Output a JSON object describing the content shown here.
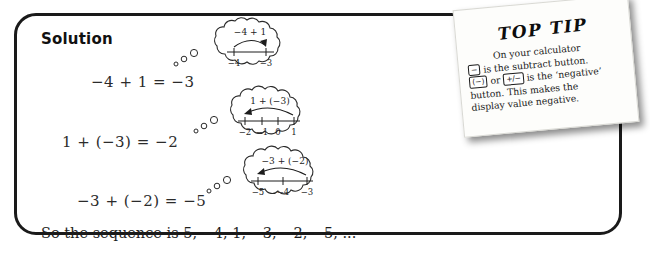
{
  "solution": {
    "title": "Solution",
    "equations": [
      {
        "id": "eq1",
        "text": "−4 + 1 = −3"
      },
      {
        "id": "eq2",
        "text": "1 + (−3) = −2"
      },
      {
        "id": "eq3",
        "text": "−3 + (−2) = −5"
      }
    ],
    "closing": "So the sequence is 5, −4, 1, −3, −2, −5, ..."
  },
  "bubbles": [
    {
      "expression": "−4 + 1",
      "tick_labels": [
        "−4",
        "−3"
      ],
      "direction": "right"
    },
    {
      "expression": "1 + (−3)",
      "tick_labels": [
        "−2",
        "−1",
        "0",
        "1"
      ],
      "direction": "left"
    },
    {
      "expression": "−3 + (−2)",
      "tick_labels": [
        "−5",
        "−4",
        "−3"
      ],
      "direction": "left"
    }
  ],
  "note": {
    "title": "TOP TIP",
    "line1_pre": "On your calculator",
    "key_minus": "−",
    "line2": "is the subtract button.",
    "key_negate": "(−)",
    "or_word": "or",
    "key_plusminus": "+/−",
    "line3": "is the ‘negative’",
    "line4": "button. This makes the",
    "line5": "display value negative."
  },
  "colors": {
    "box_border": "#1a1a1a",
    "ink": "#1d1d1d",
    "note_paper": "#fdfdfb",
    "page_background": "#ffffff"
  }
}
